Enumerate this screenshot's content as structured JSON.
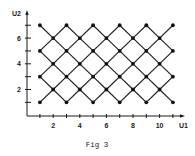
{
  "chart_data": {
    "type": "scatter",
    "title": "",
    "caption": "Fig 3",
    "xlabel": "U1",
    "ylabel": "U2",
    "xlim": [
      0,
      11.5
    ],
    "ylim": [
      0,
      7.5
    ],
    "xticks": [
      1,
      2,
      3,
      4,
      5,
      6,
      7,
      8,
      9,
      10,
      11
    ],
    "xtick_labels": [
      "2",
      "4",
      "6",
      "8",
      "10"
    ],
    "xtick_label_values": [
      2,
      4,
      6,
      8,
      10
    ],
    "yticks": [
      1,
      2,
      3,
      4,
      5,
      6,
      7
    ],
    "ytick_labels": [
      "2",
      "4",
      "6"
    ],
    "ytick_label_values": [
      2,
      4,
      6
    ],
    "grid": false,
    "legend": null,
    "points": [
      [
        1,
        1
      ],
      [
        1,
        3
      ],
      [
        1,
        5
      ],
      [
        1,
        7
      ],
      [
        2,
        2
      ],
      [
        2,
        4
      ],
      [
        2,
        6
      ],
      [
        3,
        1
      ],
      [
        3,
        3
      ],
      [
        3,
        5
      ],
      [
        3,
        7
      ],
      [
        4,
        2
      ],
      [
        4,
        4
      ],
      [
        4,
        6
      ],
      [
        5,
        1
      ],
      [
        5,
        3
      ],
      [
        5,
        5
      ],
      [
        5,
        7
      ],
      [
        6,
        2
      ],
      [
        6,
        4
      ],
      [
        6,
        6
      ],
      [
        7,
        1
      ],
      [
        7,
        3
      ],
      [
        7,
        5
      ],
      [
        7,
        7
      ],
      [
        8,
        2
      ],
      [
        8,
        4
      ],
      [
        8,
        6
      ],
      [
        9,
        1
      ],
      [
        9,
        3
      ],
      [
        9,
        5
      ],
      [
        9,
        7
      ],
      [
        10,
        2
      ],
      [
        10,
        4
      ],
      [
        10,
        6
      ],
      [
        11,
        1
      ],
      [
        11,
        3
      ],
      [
        11,
        5
      ],
      [
        11,
        7
      ]
    ],
    "lattice_bounds": {
      "u1_min": 1,
      "u1_max": 11,
      "u2_min": 1,
      "u2_max": 7
    }
  },
  "colors": {
    "ink": "#1a1a1a",
    "background": "#ffffff"
  }
}
